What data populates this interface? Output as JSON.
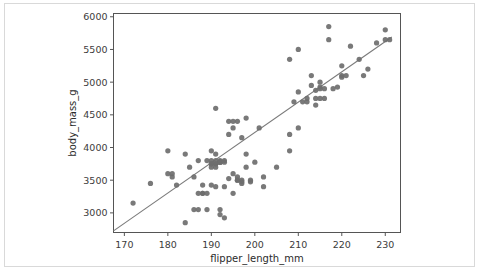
{
  "figure": {
    "background_color": "#ffffff",
    "frame_color": "#d9d9d9",
    "point_color": "#6e6e6e",
    "line_color": "#7a7a7a",
    "axis_color": "#555555"
  },
  "chart_data": {
    "type": "scatter",
    "title": "",
    "subtitle": "",
    "xlabel": "flipper_length_mm",
    "ylabel": "body_mass_g",
    "xlim": [
      167.5,
      233.5
    ],
    "ylim": [
      2700,
      6050
    ],
    "xticks": [
      170,
      180,
      190,
      200,
      210,
      220,
      230
    ],
    "yticks": [
      3000,
      3500,
      4000,
      4500,
      5000,
      5500,
      6000
    ],
    "xtick_labels": [
      "170",
      "180",
      "190",
      "200",
      "210",
      "220",
      "230"
    ],
    "ytick_labels": [
      "3000",
      "3500",
      "4000",
      "4500",
      "5000",
      "5500",
      "6000"
    ],
    "grid": false,
    "legend": null,
    "legend_position": "none",
    "annotations": [],
    "marker": "circle",
    "marker_size": 4.2,
    "series": [
      {
        "name": "penguins",
        "color": "#6e6e6e",
        "x": [
          172,
          176,
          180,
          180,
          181,
          181,
          182,
          184,
          184,
          185,
          186,
          186,
          187,
          187,
          187,
          188,
          188,
          188,
          189,
          189,
          189,
          190,
          190,
          190,
          190,
          190,
          190,
          191,
          191,
          191,
          191,
          191,
          191,
          191,
          192,
          192,
          192,
          192,
          192,
          192,
          193,
          193,
          193,
          193,
          194,
          194,
          194,
          195,
          195,
          195,
          195,
          196,
          196,
          196,
          196,
          197,
          197,
          197,
          197,
          198,
          198,
          198,
          199,
          199,
          200,
          201,
          202,
          202,
          205,
          208,
          208,
          208,
          209,
          210,
          210,
          210,
          211,
          212,
          212,
          213,
          213,
          214,
          214,
          214,
          215,
          215,
          215,
          215,
          216,
          216,
          217,
          217,
          218,
          219,
          220,
          220,
          220,
          221,
          222,
          224,
          225,
          226,
          228,
          230,
          230,
          231
        ],
        "y": [
          3150,
          3450,
          3950,
          3600,
          3600,
          3550,
          3425,
          2850,
          3900,
          3700,
          3550,
          3050,
          3800,
          3300,
          3050,
          3300,
          3300,
          3425,
          3800,
          3300,
          3050,
          3950,
          3800,
          3750,
          3750,
          3700,
          3425,
          4600,
          3900,
          3800,
          3750,
          3750,
          3700,
          3400,
          3800,
          3775,
          3775,
          3775,
          3050,
          2975,
          3800,
          3775,
          3400,
          2925,
          4400,
          4200,
          3525,
          4400,
          4300,
          3600,
          3300,
          4400,
          3550,
          3500,
          3500,
          4150,
          3500,
          3475,
          3450,
          4450,
          3900,
          3700,
          3500,
          3475,
          3775,
          4300,
          3550,
          3400,
          3700,
          5350,
          4200,
          3950,
          4700,
          5500,
          4850,
          4300,
          4700,
          4750,
          4700,
          5100,
          4950,
          4875,
          4750,
          4650,
          5000,
          4925,
          4900,
          4750,
          4900,
          4750,
          5850,
          5650,
          4900,
          4925,
          5250,
          5100,
          5075,
          5100,
          5550,
          5350,
          5100,
          5200,
          5600,
          5800,
          5650,
          5650
        ]
      }
    ],
    "regression_line": {
      "name": "linear-fit",
      "color": "#7a7a7a",
      "x_start": 167.5,
      "y_start": 2725,
      "x_end": 231.5,
      "y_end": 5690,
      "slope": 46.3,
      "intercept": -5033
    }
  }
}
